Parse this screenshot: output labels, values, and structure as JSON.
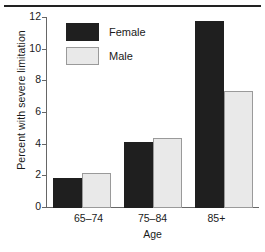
{
  "chart_data": {
    "type": "bar",
    "title": "",
    "subtitle": "",
    "xlabel": "Age",
    "ylabel": "Percent with severe limitation",
    "categories": [
      "65–74",
      "75–84",
      "85+"
    ],
    "series": [
      {
        "name": "Female",
        "values": [
          1.9,
          4.2,
          11.8
        ],
        "color": "#1f1f1f"
      },
      {
        "name": "Male",
        "values": [
          2.2,
          4.4,
          7.4
        ],
        "color": "#e9e9e9"
      }
    ],
    "ylim": [
      0,
      12
    ],
    "yticks": [
      0,
      2,
      4,
      6,
      8,
      10,
      12
    ],
    "ytick_labels": [
      "0",
      "2",
      "4",
      "6",
      "8",
      "10",
      "12"
    ],
    "grid": false,
    "legend_position": "upper left",
    "legend_entries": [
      "Female",
      "Male"
    ],
    "annotations": [],
    "top_rule": true
  },
  "axes": {
    "y_title": "Percent with severe limitation",
    "x_title": "Age"
  },
  "legend": {
    "female_label": "Female",
    "male_label": "Male"
  },
  "xticks": {
    "t0": "65–74",
    "t1": "75–84",
    "t2": "85+"
  },
  "yticks": {
    "t0": "0",
    "t1": "2",
    "t2": "4",
    "t3": "6",
    "t4": "8",
    "t5": "10",
    "t6": "12"
  }
}
